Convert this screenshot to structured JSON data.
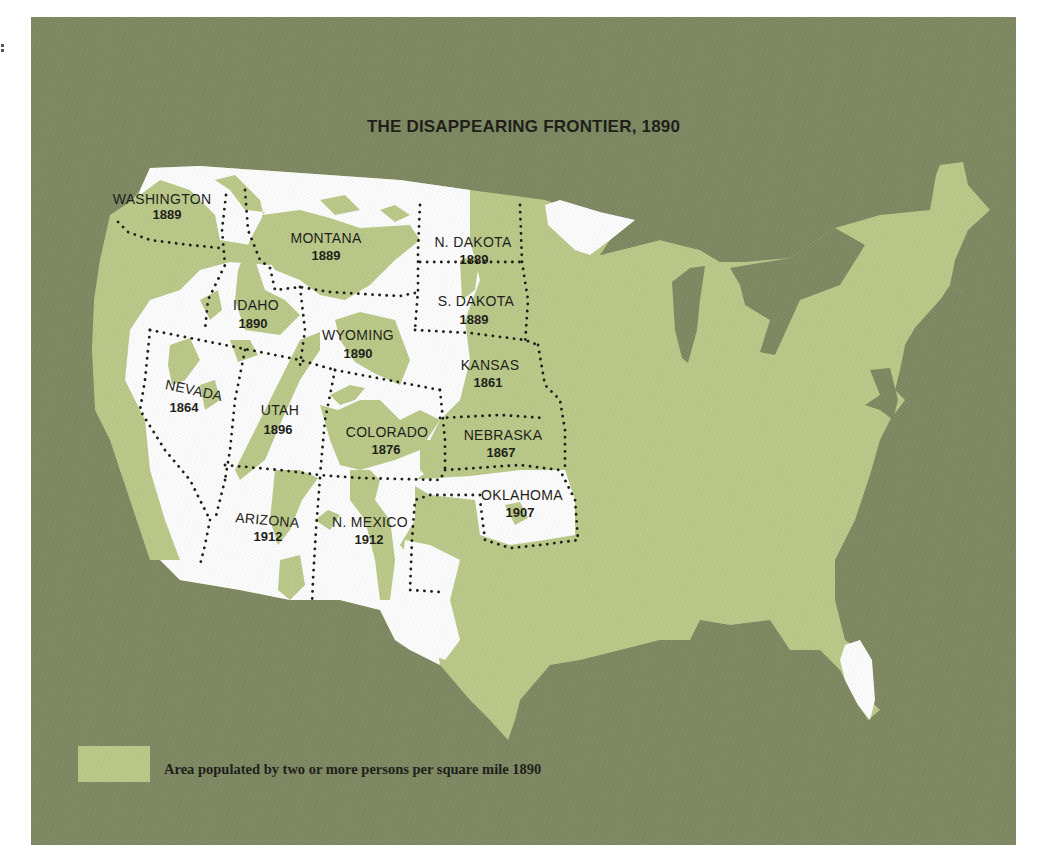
{
  "map": {
    "title": "THE DISAPPEARING FRONTIER, 1890",
    "colors": {
      "background": "#7f8a62",
      "populated": "#bccb8a",
      "frontier": "#ffffff",
      "border_dots": "#1d1d18",
      "text": "#1d1d18"
    },
    "states": [
      {
        "name": "WASHINGTON",
        "year": "1889"
      },
      {
        "name": "MONTANA",
        "year": "1889"
      },
      {
        "name": "N. DAKOTA",
        "year": "1889"
      },
      {
        "name": "IDAHO",
        "year": "1890"
      },
      {
        "name": "S. DAKOTA",
        "year": "1889"
      },
      {
        "name": "WYOMING",
        "year": "1890"
      },
      {
        "name": "KANSAS",
        "year": "1861"
      },
      {
        "name": "NEVADA",
        "year": "1864"
      },
      {
        "name": "UTAH",
        "year": "1896"
      },
      {
        "name": "COLORADO",
        "year": "1876"
      },
      {
        "name": "NEBRASKA",
        "year": "1867"
      },
      {
        "name": "OKLAHOMA",
        "year": "1907"
      },
      {
        "name": "ARIZONA",
        "year": "1912"
      },
      {
        "name": "N. MEXICO",
        "year": "1912"
      }
    ],
    "legend": {
      "swatch_color": "#bccb8a",
      "label": "Area populated by two or more persons per square mile 1890"
    }
  }
}
